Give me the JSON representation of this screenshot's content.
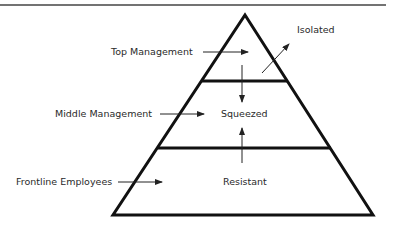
{
  "diagram": {
    "type": "pyramid",
    "tiers": [
      {
        "name": "Top Management",
        "state": "Isolated"
      },
      {
        "name": "Middle Management",
        "state": "Squeezed"
      },
      {
        "name": "Frontline Employees",
        "state": "Resistant"
      }
    ],
    "labels": {
      "top": "Top Management",
      "middle": "Middle Management",
      "frontline": "Frontline Employees",
      "isolated": "Isolated",
      "squeezed": "Squeezed",
      "resistant": "Resistant"
    },
    "colors": {
      "line": "#111111",
      "text": "#2a2a2a",
      "rule": "#444444"
    }
  }
}
